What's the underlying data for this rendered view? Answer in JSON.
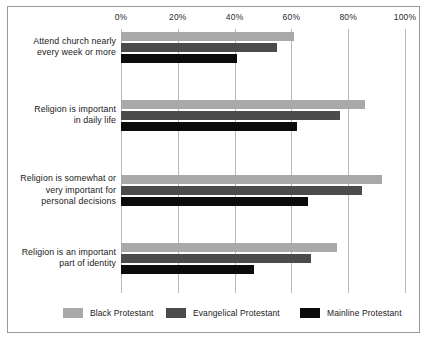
{
  "chart_data": {
    "type": "bar",
    "orientation": "horizontal",
    "title": "",
    "xlabel": "",
    "ylabel": "",
    "xlim": [
      0,
      100
    ],
    "xticks": [
      0,
      20,
      40,
      60,
      80,
      100
    ],
    "xtick_labels": [
      "0%",
      "20%",
      "40%",
      "60%",
      "80%",
      "100%"
    ],
    "grid": true,
    "legend_position": "bottom",
    "categories": [
      "Attend church nearly every week or more",
      "Religion is important in daily life",
      "Religion is somewhat or very important for personal decisions",
      "Religion is an important part of identity"
    ],
    "category_lines": [
      [
        "Attend church nearly",
        "every week or more"
      ],
      [
        "Religion is important",
        "in daily life"
      ],
      [
        "Religion is somewhat or",
        "very important for",
        "personal decisions"
      ],
      [
        "Religion is an important",
        "part of identity"
      ]
    ],
    "series": [
      {
        "name": "Black Protestant",
        "color": "#a9a9a9",
        "values": [
          61,
          86,
          92,
          76
        ]
      },
      {
        "name": "Evangelical Protestant",
        "color": "#4b4b4b",
        "values": [
          55,
          77,
          85,
          67
        ]
      },
      {
        "name": "Mainline Protestant",
        "color": "#0b0b0b",
        "values": [
          41,
          62,
          66,
          47
        ]
      }
    ]
  },
  "legend": {
    "items": [
      {
        "label": "Black Protestant"
      },
      {
        "label": "Evangelical Protestant"
      },
      {
        "label": "Mainline Protestant"
      }
    ]
  }
}
